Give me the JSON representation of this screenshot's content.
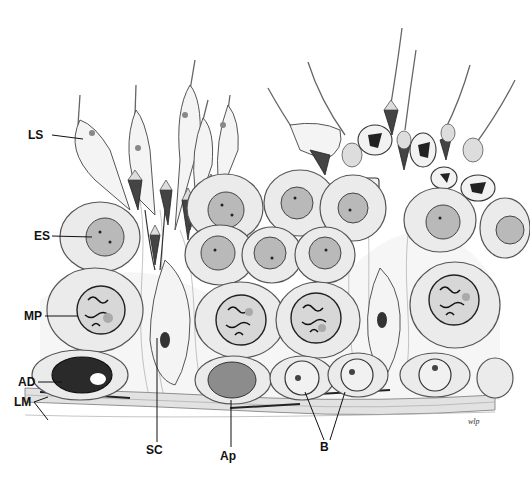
{
  "figure": {
    "labels": {
      "LS": "LS",
      "ES": "ES",
      "MP": "MP",
      "AD": "AD",
      "LM": "LM",
      "SC": "SC",
      "Ap": "Ap",
      "B": "B"
    },
    "signature": "wlp"
  }
}
